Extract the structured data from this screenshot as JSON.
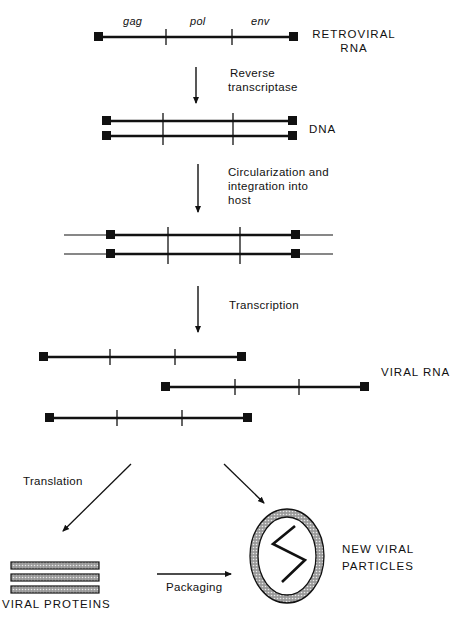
{
  "diagram": {
    "genes": [
      "gag",
      "pol",
      "env"
    ],
    "stages": {
      "retroviral_rna": {
        "label_line1": "RETROVIRAL",
        "label_line2": "RNA"
      },
      "dna": {
        "label": "DNA"
      },
      "viral_rna": {
        "label": "VIRAL RNA"
      },
      "viral_proteins": {
        "label": "VIRAL PROTEINS"
      },
      "new_viral_particles": {
        "label_line1": "NEW VIRAL",
        "label_line2": "PARTICLES"
      }
    },
    "steps": {
      "reverse_transcription": {
        "line1": "Reverse",
        "line2": "transcriptase"
      },
      "integration": {
        "line1": "Circularization and",
        "line2": "integration into",
        "line3": "host"
      },
      "transcription": {
        "label": "Transcription"
      },
      "translation": {
        "label": "Translation"
      },
      "packaging": {
        "label": "Packaging"
      }
    }
  }
}
